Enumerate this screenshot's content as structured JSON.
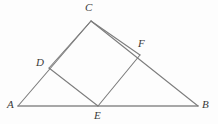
{
  "figure": {
    "kind": "geometry-diagram",
    "background_color": "#fdfdfd",
    "stroke_color": "#7d7d7d",
    "baseline_stroke_color": "#8a8a8a",
    "label_color": "#3a3a3a",
    "points": {
      "A": {
        "label": "A",
        "x": 18,
        "y": 106
      },
      "B": {
        "label": "B",
        "x": 198,
        "y": 106
      },
      "C": {
        "label": "C",
        "x": 91,
        "y": 21
      },
      "D": {
        "label": "D",
        "x": 49,
        "y": 68
      },
      "E": {
        "label": "E",
        "x": 98,
        "y": 106
      },
      "F": {
        "label": "F",
        "x": 140,
        "y": 55
      }
    },
    "segments": [
      {
        "name": "AB",
        "from": "A",
        "to": "B",
        "width": 1.6
      },
      {
        "name": "AC",
        "from": "A",
        "to": "C",
        "width": 1.1
      },
      {
        "name": "CB",
        "from": "C",
        "to": "B",
        "width": 1.1
      },
      {
        "name": "DE",
        "from": "D",
        "to": "E",
        "width": 1.1
      },
      {
        "name": "EF",
        "from": "E",
        "to": "F",
        "width": 1.1
      },
      {
        "name": "DC",
        "from": "D",
        "to": "C",
        "width": 1.1
      },
      {
        "name": "CF",
        "from": "C",
        "to": "F",
        "width": 1.1
      }
    ]
  }
}
